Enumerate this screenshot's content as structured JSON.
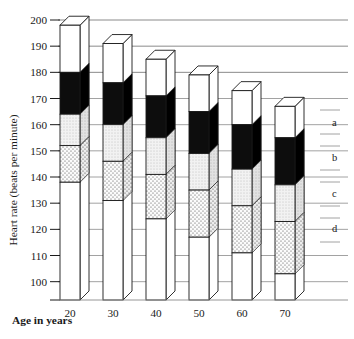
{
  "chart_data": {
    "type": "bar",
    "title": "",
    "subtitle": "",
    "xlabel": "Age in years",
    "ylabel": "Heart rate (beats per minute)",
    "categories": [
      "20",
      "30",
      "40",
      "50",
      "60",
      "70"
    ],
    "ylim": [
      93,
      200
    ],
    "yticks": [
      100,
      110,
      120,
      130,
      140,
      150,
      160,
      170,
      180,
      190,
      200
    ],
    "ytick_labels": [
      "100",
      "110",
      "120",
      "130",
      "140",
      "150",
      "160",
      "170",
      "180",
      "190",
      "200"
    ],
    "grid": true,
    "grid_axis": "y",
    "legend_position": "right",
    "legend_entries": [
      {
        "key": "a",
        "label": "a",
        "fill": "white"
      },
      {
        "key": "b",
        "label": "b",
        "fill": "black"
      },
      {
        "key": "c",
        "label": "c",
        "fill": "light-stipple"
      },
      {
        "key": "d",
        "label": "d",
        "fill": "dotted-stipple"
      }
    ],
    "stacked": true,
    "bar_style": "3d-column",
    "series": [
      {
        "name": "a",
        "zone": "white upper zone",
        "tops": [
          198,
          191,
          185,
          179,
          173,
          167
        ],
        "bottoms": [
          180,
          176,
          171,
          165,
          160,
          155
        ]
      },
      {
        "name": "b",
        "zone": "black zone",
        "tops": [
          180,
          176,
          171,
          165,
          160,
          155
        ],
        "bottoms": [
          164,
          160,
          155,
          149,
          143,
          137
        ]
      },
      {
        "name": "c",
        "zone": "light stipple zone",
        "tops": [
          164,
          160,
          155,
          149,
          143,
          137
        ],
        "bottoms": [
          152,
          146,
          141,
          135,
          129,
          123
        ]
      },
      {
        "name": "d",
        "zone": "dotted stipple zone",
        "tops": [
          152,
          146,
          141,
          135,
          129,
          123
        ],
        "bottoms": [
          138,
          131,
          124,
          117,
          111,
          103
        ]
      },
      {
        "name": "base",
        "zone": "white lower zone",
        "tops": [
          138,
          131,
          124,
          117,
          111,
          103
        ],
        "bottoms": [
          93,
          93,
          93,
          93,
          93,
          93
        ]
      }
    ],
    "colors": {
      "black": "#0d0d0d",
      "light_stipple": "#ececec",
      "dotted_stipple": "#f4f4f4",
      "white": "#ffffff",
      "outline": "#1a1a1a",
      "gridline": "#8a8a8a",
      "axis": "#1a1a1a"
    }
  },
  "axis": {
    "y_title": "Heart rate (beats per minute)",
    "x_title": "Age in years"
  }
}
